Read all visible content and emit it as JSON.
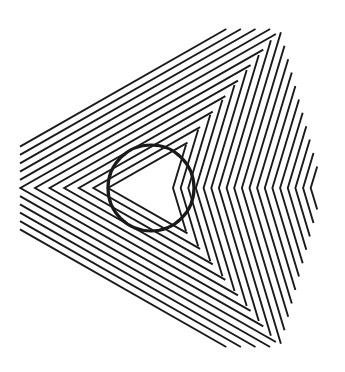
{
  "figure": {
    "title": "Orbison-style illusion: circle over nested chevron triangles",
    "background": "#ffffff",
    "ink": "#1a1a1a",
    "line_width": 1.9,
    "center_y": 188,
    "clip": {
      "left": 20,
      "top": 29,
      "bottom": 347,
      "right": 323,
      "top_right_corner": [
        280,
        29
      ],
      "right_vertex_y": 188
    },
    "boundary": {
      "inner": [
        184,
        147
      ],
      "outer": [
        280,
        29
      ]
    },
    "shallow_chevrons": {
      "apex_start_x": 108,
      "apex_step_x": -14.6,
      "count": 12,
      "slope": 0.57
    },
    "steep_chevrons": {
      "vertex_start_x": 173,
      "vertex_step_x": 7.65,
      "count": 19,
      "dx_per_dy": 0.3
    },
    "circle": {
      "cx": 151,
      "cy": 188,
      "r": 43,
      "stroke_width": 3.2,
      "color": "#1a1a1a"
    }
  }
}
